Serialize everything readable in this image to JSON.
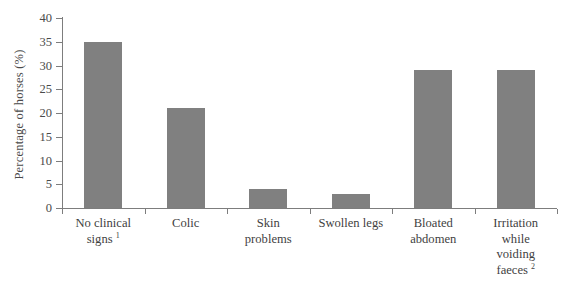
{
  "chart_data": {
    "type": "bar",
    "title": "",
    "xlabel": "",
    "ylabel": "Percentage of horses (%)",
    "ylim": [
      0,
      40
    ],
    "ytick_step": 5,
    "yticks": [
      40,
      35,
      30,
      25,
      20,
      15,
      10,
      5,
      0
    ],
    "grid": false,
    "legend": null,
    "bar_color": "#808080",
    "axis_color": "#7d7d7d",
    "background": "#ffffff",
    "categories": [
      "No clinical signs",
      "Colic",
      "Skin problems",
      "Swollen legs",
      "Bloated abdomen",
      "Irritation while voiding faeces"
    ],
    "category_labels": [
      {
        "lines": [
          "No clinical",
          "signs"
        ],
        "footnote": "1"
      },
      {
        "lines": [
          "Colic"
        ],
        "footnote": ""
      },
      {
        "lines": [
          "Skin",
          "problems"
        ],
        "footnote": ""
      },
      {
        "lines": [
          "Swollen legs"
        ],
        "footnote": ""
      },
      {
        "lines": [
          "Bloated",
          "abdomen"
        ],
        "footnote": ""
      },
      {
        "lines": [
          "Irritation",
          "while",
          "voiding",
          "faeces"
        ],
        "footnote": "2"
      }
    ],
    "values": [
      35,
      21,
      4,
      3,
      29,
      29
    ]
  }
}
